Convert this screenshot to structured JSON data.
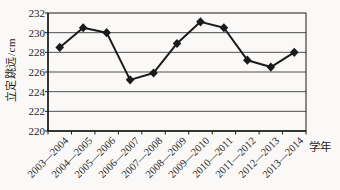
{
  "chart_data": {
    "type": "line",
    "categories": [
      "2003—2004",
      "2004—2005",
      "2005—2006",
      "2006—2007",
      "2007—2008",
      "2008—2009",
      "2009—2010",
      "2010—2011",
      "2011—2012",
      "2012—2013",
      "2013—2014"
    ],
    "values": [
      228.5,
      230.5,
      230.0,
      225.2,
      225.9,
      228.9,
      231.1,
      230.5,
      227.2,
      226.5,
      228.0
    ],
    "title": "",
    "xlabel": "学年",
    "ylabel": "立定跳远/cm",
    "ylim": [
      220,
      232
    ],
    "yticks": [
      220,
      222,
      224,
      226,
      228,
      230,
      232
    ],
    "grid": true,
    "legend": "none",
    "marker": "diamond"
  },
  "colors": {
    "line": "#1a1a1a",
    "marker": "#1a1a1a",
    "grid": "#4f4f4f",
    "axis": "#1a1a1a",
    "text": "#1c1c1c",
    "background": "#faf9f7"
  }
}
